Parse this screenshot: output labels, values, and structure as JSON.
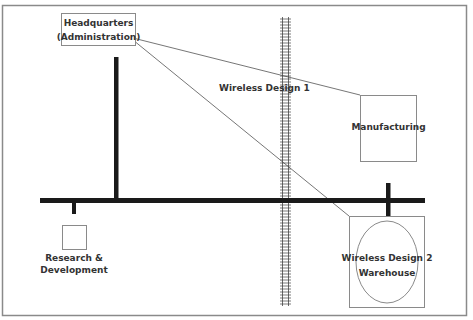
{
  "diagram": {
    "nodes": {
      "headquarters": {
        "line1": "Headquarters",
        "line2": "(Administration)"
      },
      "manufacturing": {
        "label": "Manufacturing"
      },
      "research": {
        "line1": "Research &",
        "line2": "Development"
      },
      "warehouse": {
        "line1": "Wireless Design 2",
        "line2": "Warehouse"
      }
    },
    "links": {
      "wireless1": {
        "label": "Wireless Design 1"
      }
    },
    "colors": {
      "road": "#1a1a1a",
      "frame": "#888888",
      "box": "#8a8a8a",
      "link": "#666666",
      "text": "#333333"
    }
  }
}
